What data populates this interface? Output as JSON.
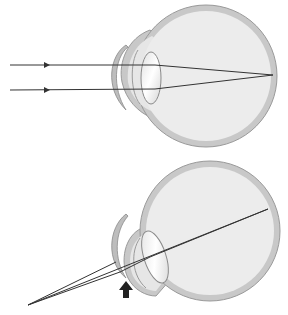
{
  "diagram": {
    "type": "optics-eye",
    "panels": [
      {
        "name": "normal-vision",
        "description": "Parallel rays through corrective lens focus on retina",
        "rays": 2,
        "has_arrow_marker": false
      },
      {
        "name": "corrected-vision",
        "description": "Diverging rays from near point cross at lens and reach retina",
        "rays": 2,
        "has_arrow_marker": true
      }
    ],
    "colors": {
      "background": "#ffffff",
      "sclera": "#c8c8c8",
      "eye_fill": "#ececec",
      "ray": "#333333",
      "lens_edge": "#8a8a8a",
      "arrow": "#222222"
    }
  }
}
